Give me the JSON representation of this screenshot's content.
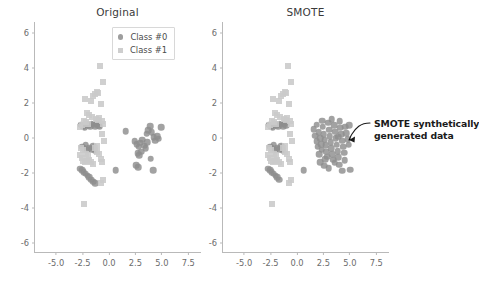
{
  "figure": {
    "background": "#ffffff",
    "marker_color_class0": "#8d8d8d",
    "marker_color_class1": "#c9c9c9",
    "axis_color": "#b9b9b9",
    "text_color": "#3a3a3a"
  },
  "legend": {
    "entries": [
      {
        "label": "Class #0",
        "marker": "circle-marker",
        "color": "#8d8d8d"
      },
      {
        "label": "Class #1",
        "marker": "square-marker",
        "color": "#c9c9c9"
      }
    ]
  },
  "annotation": {
    "line1": "SMOTE synthetically",
    "line2": "generated data",
    "bold_token": "SMOTE",
    "arrow": "curved-arrow-icon"
  },
  "chart_data": [
    {
      "type": "scatter",
      "title": "Original",
      "xlabel": "",
      "ylabel": "",
      "xlim": [
        -7.0,
        8.8
      ],
      "ylim": [
        -6.6,
        6.6
      ],
      "xticks": [
        "-5.0",
        "-2.5",
        "0.0",
        "2.5",
        "5.0",
        "7.5"
      ],
      "xtick_values": [
        -5.0,
        -2.5,
        0.0,
        2.5,
        5.0,
        7.5
      ],
      "yticks": [
        "6",
        "4",
        "2",
        "0",
        "-2",
        "-4",
        "-6"
      ],
      "ytick_values": [
        6,
        4,
        2,
        0,
        -2,
        -4,
        -6
      ],
      "grid": false,
      "legend_position": "upper-center",
      "series": [
        {
          "name": "Class #0",
          "marker": "circle",
          "color": "#8d8d8d",
          "points": [
            [
              -2.65,
              0.72
            ],
            [
              -2.45,
              0.66
            ],
            [
              -2.3,
              0.6
            ],
            [
              -2.12,
              0.78
            ],
            [
              -1.95,
              0.7
            ],
            [
              -1.78,
              0.62
            ],
            [
              -1.62,
              0.8
            ],
            [
              -1.48,
              0.74
            ],
            [
              -1.32,
              0.66
            ],
            [
              -1.18,
              0.82
            ],
            [
              -1.02,
              0.7
            ],
            [
              -0.88,
              0.64
            ],
            [
              -2.55,
              -0.52
            ],
            [
              -2.38,
              -0.62
            ],
            [
              -2.2,
              -0.45
            ],
            [
              -2.05,
              -0.7
            ],
            [
              -1.88,
              -0.58
            ],
            [
              -1.7,
              -0.66
            ],
            [
              -1.52,
              -0.5
            ],
            [
              -1.35,
              -0.74
            ],
            [
              -2.72,
              -1.78
            ],
            [
              -2.55,
              -1.88
            ],
            [
              -2.38,
              -1.98
            ],
            [
              -2.2,
              -2.08
            ],
            [
              -2.02,
              -2.18
            ],
            [
              -1.85,
              -2.28
            ],
            [
              -1.68,
              -2.4
            ],
            [
              -1.5,
              -2.52
            ],
            [
              -1.32,
              -2.62
            ],
            [
              0.62,
              -1.88
            ],
            [
              1.58,
              0.36
            ],
            [
              2.45,
              -0.22
            ],
            [
              2.62,
              -0.38
            ],
            [
              2.8,
              -0.52
            ],
            [
              2.98,
              -0.3
            ],
            [
              3.15,
              -0.12
            ],
            [
              3.32,
              -0.48
            ],
            [
              3.48,
              -0.62
            ],
            [
              3.62,
              -0.28
            ],
            [
              2.7,
              -0.9
            ],
            [
              2.88,
              -1.02
            ],
            [
              3.05,
              -0.82
            ],
            [
              3.55,
              0.22
            ],
            [
              3.72,
              0.42
            ],
            [
              3.88,
              0.66
            ],
            [
              4.05,
              0.3
            ],
            [
              4.22,
              0.02
            ],
            [
              4.38,
              -0.18
            ],
            [
              4.55,
              0.08
            ],
            [
              4.72,
              -0.06
            ],
            [
              4.95,
              0.58
            ],
            [
              2.6,
              -1.58
            ],
            [
              2.78,
              -1.7
            ],
            [
              3.95,
              -1.22
            ],
            [
              4.18,
              -1.88
            ]
          ]
        },
        {
          "name": "Class #1",
          "marker": "square",
          "color": "#c9c9c9",
          "points": [
            [
              -0.88,
              4.06
            ],
            [
              -0.52,
              3.18
            ],
            [
              -2.3,
              2.22
            ],
            [
              -1.52,
              2.38
            ],
            [
              -1.35,
              2.5
            ],
            [
              -1.18,
              2.6
            ],
            [
              -1.02,
              2.52
            ],
            [
              -1.72,
              2.1
            ],
            [
              -0.72,
              1.9
            ],
            [
              -2.05,
              1.38
            ],
            [
              -1.88,
              1.3
            ],
            [
              -1.62,
              1.2
            ],
            [
              -2.35,
              0.96
            ],
            [
              -2.52,
              0.74
            ],
            [
              -2.7,
              0.6
            ],
            [
              -2.18,
              0.88
            ],
            [
              -2.0,
              0.8
            ],
            [
              -1.25,
              1.08
            ],
            [
              -1.08,
              0.98
            ],
            [
              -0.92,
              1.12
            ],
            [
              -0.68,
              0.92
            ],
            [
              -0.52,
              0.78
            ],
            [
              -0.62,
              0.2
            ],
            [
              -0.48,
              -0.18
            ],
            [
              -2.62,
              -0.58
            ],
            [
              -2.48,
              -0.72
            ],
            [
              -2.78,
              -1.02
            ],
            [
              -2.6,
              -1.18
            ],
            [
              -2.42,
              -1.32
            ],
            [
              -2.25,
              -1.4
            ],
            [
              -2.05,
              -1.35
            ],
            [
              -1.88,
              -1.28
            ],
            [
              -1.68,
              -1.42
            ],
            [
              -1.48,
              -1.5
            ],
            [
              -1.12,
              -0.82
            ],
            [
              -0.95,
              -0.95
            ],
            [
              -0.78,
              -1.2
            ],
            [
              -0.62,
              -1.38
            ],
            [
              -1.28,
              -0.62
            ],
            [
              -1.1,
              -0.48
            ],
            [
              -2.15,
              -0.92
            ],
            [
              -1.98,
              -1.05
            ],
            [
              -0.55,
              -2.42
            ],
            [
              -0.72,
              -2.62
            ],
            [
              -2.32,
              -3.82
            ]
          ]
        }
      ]
    },
    {
      "type": "scatter",
      "title": "SMOTE",
      "xlabel": "",
      "ylabel": "",
      "xlim": [
        -7.0,
        8.8
      ],
      "ylim": [
        -6.6,
        6.6
      ],
      "xticks": [
        "-5.0",
        "-2.5",
        "0.0",
        "2.5",
        "5.0",
        "7.5"
      ],
      "xtick_values": [
        -5.0,
        -2.5,
        0.0,
        2.5,
        5.0,
        7.5
      ],
      "yticks": [
        "6",
        "4",
        "2",
        "0",
        "-2",
        "-4",
        "-6"
      ],
      "ytick_values": [
        6,
        4,
        2,
        0,
        -2,
        -4,
        -6
      ],
      "grid": false,
      "legend_position": "none",
      "series": [
        {
          "name": "Class #0",
          "marker": "circle",
          "color": "#8d8d8d",
          "points": [
            [
              -2.65,
              0.72
            ],
            [
              -2.45,
              0.66
            ],
            [
              -2.3,
              0.6
            ],
            [
              -2.12,
              0.78
            ],
            [
              -1.95,
              0.7
            ],
            [
              -1.78,
              0.62
            ],
            [
              -1.62,
              0.8
            ],
            [
              -1.48,
              0.74
            ],
            [
              -1.32,
              0.66
            ],
            [
              -1.18,
              0.82
            ],
            [
              -1.02,
              0.7
            ],
            [
              -2.55,
              -0.52
            ],
            [
              -2.38,
              -0.62
            ],
            [
              -2.2,
              -0.45
            ],
            [
              -2.05,
              -0.7
            ],
            [
              -1.88,
              -0.58
            ],
            [
              -1.7,
              -0.66
            ],
            [
              -1.52,
              -0.5
            ],
            [
              -1.35,
              -0.74
            ],
            [
              -2.72,
              -1.78
            ],
            [
              -2.55,
              -1.88
            ],
            [
              -2.38,
              -1.98
            ],
            [
              -2.2,
              -2.08
            ],
            [
              -2.02,
              -2.18
            ],
            [
              -1.85,
              -2.28
            ],
            [
              -1.68,
              -2.4
            ],
            [
              0.62,
              -1.88
            ],
            [
              1.58,
              0.46
            ],
            [
              1.75,
              0.1
            ],
            [
              1.88,
              -0.2
            ],
            [
              1.95,
              -0.52
            ],
            [
              2.05,
              0.3
            ],
            [
              2.18,
              -0.05
            ],
            [
              2.28,
              -0.38
            ],
            [
              2.35,
              -0.7
            ],
            [
              2.45,
              0.62
            ],
            [
              2.52,
              0.2
            ],
            [
              2.62,
              -0.12
            ],
            [
              2.7,
              -0.45
            ],
            [
              2.78,
              -0.8
            ],
            [
              2.85,
              -1.1
            ],
            [
              2.95,
              0.85
            ],
            [
              3.02,
              0.45
            ],
            [
              3.1,
              0.08
            ],
            [
              3.18,
              -0.28
            ],
            [
              3.25,
              -0.6
            ],
            [
              3.35,
              -0.95
            ],
            [
              3.42,
              -1.28
            ],
            [
              3.52,
              0.7
            ],
            [
              3.6,
              0.32
            ],
            [
              3.68,
              -0.05
            ],
            [
              3.75,
              -0.42
            ],
            [
              3.85,
              -0.78
            ],
            [
              3.92,
              -1.12
            ],
            [
              4.0,
              -1.55
            ],
            [
              4.1,
              0.55
            ],
            [
              4.18,
              0.18
            ],
            [
              4.28,
              -0.18
            ],
            [
              4.35,
              -0.52
            ],
            [
              4.45,
              -0.88
            ],
            [
              4.58,
              0.62
            ],
            [
              4.68,
              0.25
            ],
            [
              4.78,
              -0.1
            ],
            [
              4.88,
              -0.42
            ],
            [
              4.95,
              0.7
            ],
            [
              2.2,
              -1.42
            ],
            [
              2.55,
              -1.6
            ],
            [
              3.0,
              -1.75
            ],
            [
              4.3,
              -1.9
            ],
            [
              5.05,
              -1.85
            ],
            [
              2.4,
              0.95
            ],
            [
              3.3,
              1.05
            ],
            [
              4.05,
              0.92
            ],
            [
              1.85,
              0.72
            ],
            [
              2.65,
              -1.25
            ],
            [
              3.55,
              -1.45
            ],
            [
              4.5,
              -1.3
            ],
            [
              2.1,
              -0.95
            ],
            [
              3.9,
              0.05
            ]
          ]
        },
        {
          "name": "Class #1",
          "marker": "square",
          "color": "#c9c9c9",
          "points": [
            [
              -0.88,
              4.06
            ],
            [
              -0.52,
              3.18
            ],
            [
              -2.3,
              2.22
            ],
            [
              -1.52,
              2.38
            ],
            [
              -1.35,
              2.5
            ],
            [
              -1.18,
              2.6
            ],
            [
              -1.02,
              2.52
            ],
            [
              -1.72,
              2.1
            ],
            [
              -0.72,
              1.9
            ],
            [
              -2.05,
              1.38
            ],
            [
              -1.88,
              1.3
            ],
            [
              -1.62,
              1.2
            ],
            [
              -2.35,
              0.96
            ],
            [
              -2.52,
              0.74
            ],
            [
              -2.7,
              0.6
            ],
            [
              -2.18,
              0.88
            ],
            [
              -2.0,
              0.8
            ],
            [
              -1.25,
              1.08
            ],
            [
              -1.08,
              0.98
            ],
            [
              -0.92,
              1.12
            ],
            [
              -0.68,
              0.92
            ],
            [
              -0.52,
              0.78
            ],
            [
              -0.62,
              0.2
            ],
            [
              -0.48,
              -0.18
            ],
            [
              -2.62,
              -0.58
            ],
            [
              -2.48,
              -0.72
            ],
            [
              -2.78,
              -1.02
            ],
            [
              -2.6,
              -1.18
            ],
            [
              -2.42,
              -1.32
            ],
            [
              -2.25,
              -1.4
            ],
            [
              -2.05,
              -1.35
            ],
            [
              -1.88,
              -1.28
            ],
            [
              -1.68,
              -1.42
            ],
            [
              -1.48,
              -1.5
            ],
            [
              -1.12,
              -0.82
            ],
            [
              -0.95,
              -0.95
            ],
            [
              -0.78,
              -1.2
            ],
            [
              -0.62,
              -1.38
            ],
            [
              -1.28,
              -0.62
            ],
            [
              -1.1,
              -0.48
            ],
            [
              -2.15,
              -0.92
            ],
            [
              -1.98,
              -1.05
            ],
            [
              -0.55,
              -2.42
            ],
            [
              -0.72,
              -2.62
            ],
            [
              -2.32,
              -3.82
            ]
          ]
        }
      ]
    }
  ]
}
